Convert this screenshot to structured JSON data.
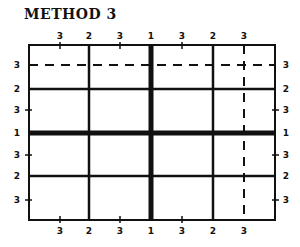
{
  "title": "METHOD 3",
  "frame": {
    "x1": 29,
    "y1": 45,
    "x2": 275,
    "y2": 220
  },
  "colors": {
    "ink": "#111111",
    "background": "#ffffff"
  },
  "vertical_lines": [
    {
      "label": "2",
      "x": 89,
      "style": "solid",
      "weight": 2.5
    },
    {
      "label": "1",
      "x": 151,
      "style": "thick",
      "weight": 5
    },
    {
      "label": "2",
      "x": 213,
      "style": "solid",
      "weight": 2.5
    },
    {
      "label": "3",
      "x": 244,
      "style": "dashed",
      "weight": 2
    }
  ],
  "vertical_ticks": [
    {
      "label": "3",
      "x": 60
    },
    {
      "label": "3",
      "x": 120
    },
    {
      "label": "3",
      "x": 182
    }
  ],
  "horizontal_lines": [
    {
      "label": "3",
      "y": 65,
      "style": "dashed",
      "weight": 2
    },
    {
      "label": "2",
      "y": 89,
      "style": "solid",
      "weight": 2.5
    },
    {
      "label": "1",
      "y": 133,
      "style": "thick",
      "weight": 5
    },
    {
      "label": "2",
      "y": 176,
      "style": "solid",
      "weight": 2.5
    }
  ],
  "horizontal_ticks": [
    {
      "label": "3",
      "y": 110
    },
    {
      "label": "3",
      "y": 155
    },
    {
      "label": "3",
      "y": 200
    }
  ],
  "top_labels": [
    "3",
    "2",
    "3",
    "1",
    "3",
    "2",
    "3"
  ],
  "bottom_labels": [
    "3",
    "2",
    "3",
    "1",
    "3",
    "2",
    "3"
  ],
  "left_labels": [
    "3",
    "2",
    "3",
    "1",
    "3",
    "2",
    "3"
  ],
  "right_labels": [
    "3",
    "2",
    "3",
    "1",
    "3",
    "2",
    "3"
  ]
}
